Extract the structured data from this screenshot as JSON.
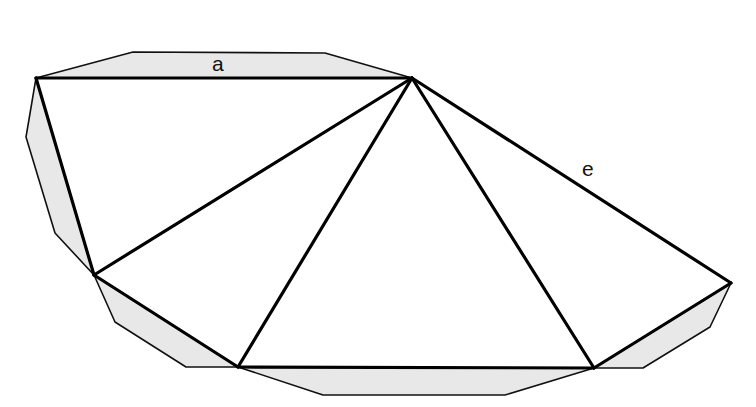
{
  "diagram": {
    "labels": [
      {
        "id": "a",
        "text": "a",
        "x": 220,
        "y": 70
      },
      {
        "id": "e",
        "text": "e",
        "x": 589,
        "y": 176
      }
    ],
    "colors": {
      "flap": "#e8e8e8",
      "edge": "#000000",
      "background": "#ffffff"
    },
    "vertices": {
      "A": [
        36,
        78
      ],
      "P": [
        412,
        78
      ],
      "B": [
        94,
        275
      ],
      "C": [
        238,
        367
      ],
      "D": [
        594,
        368
      ],
      "E": [
        731,
        283
      ]
    }
  }
}
